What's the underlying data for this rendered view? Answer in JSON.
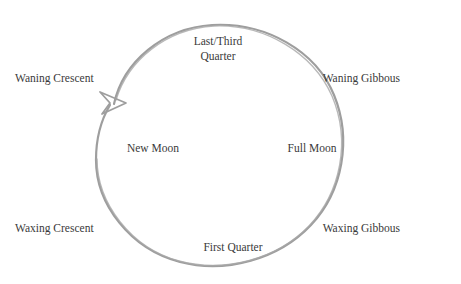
{
  "diagram": {
    "type": "moon-phase-cycle",
    "title": "",
    "circle": {
      "center_x": 218,
      "center_y": 147,
      "radius": 122,
      "stroke_color": "#9e9e9e",
      "stroke_width": 2.2
    },
    "arrowhead": {
      "name": "counterclockwise-arrowhead",
      "position_x": 110,
      "position_y": 103,
      "color": "#9e9e9e"
    },
    "background_color": "#ffffff",
    "text_color": "#3a3a3a",
    "labels": [
      {
        "id": "last-third-quarter",
        "text": "Last/Third\nQuarter",
        "x": 218,
        "y": 48
      },
      {
        "id": "waning-gibbous",
        "text": "Waning Gibbous",
        "x": 404,
        "y": 78
      },
      {
        "id": "full-moon",
        "text": "Full Moon",
        "x": 312,
        "y": 148
      },
      {
        "id": "waxing-gibbous",
        "text": "Waxing Gibbous",
        "x": 404,
        "y": 228
      },
      {
        "id": "first-quarter",
        "text": "First Quarter",
        "x": 233,
        "y": 247
      },
      {
        "id": "waxing-crescent",
        "text": "Waxing Crescent",
        "x": 66,
        "y": 228
      },
      {
        "id": "new-moon",
        "text": "New Moon",
        "x": 153,
        "y": 148
      },
      {
        "id": "waning-crescent",
        "text": "Waning Crescent",
        "x": 66,
        "y": 78
      }
    ]
  }
}
